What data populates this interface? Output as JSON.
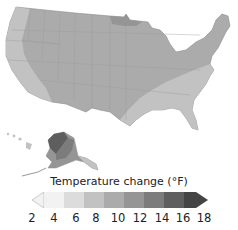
{
  "map": {
    "title": "",
    "regions": [
      "Contiguous United States",
      "Alaska",
      "Hawaii"
    ],
    "description": "Projected temperature change across the United States"
  },
  "legend": {
    "title": "Temperature change (°F)",
    "ticks": [
      "2",
      "4",
      "6",
      "8",
      "10",
      "12",
      "14",
      "16",
      "18"
    ],
    "bins": [
      {
        "range": "2-4",
        "color": "#f2f2f2"
      },
      {
        "range": "4-6",
        "color": "#dcdcdc"
      },
      {
        "range": "6-8",
        "color": "#c2c2c2"
      },
      {
        "range": "8-10",
        "color": "#ababab"
      },
      {
        "range": "10-12",
        "color": "#959595"
      },
      {
        "range": "12-14",
        "color": "#7c7c7c"
      },
      {
        "range": "14-16",
        "color": "#5e5e5e"
      },
      {
        "range": "16-18",
        "color": "#444444"
      }
    ]
  }
}
